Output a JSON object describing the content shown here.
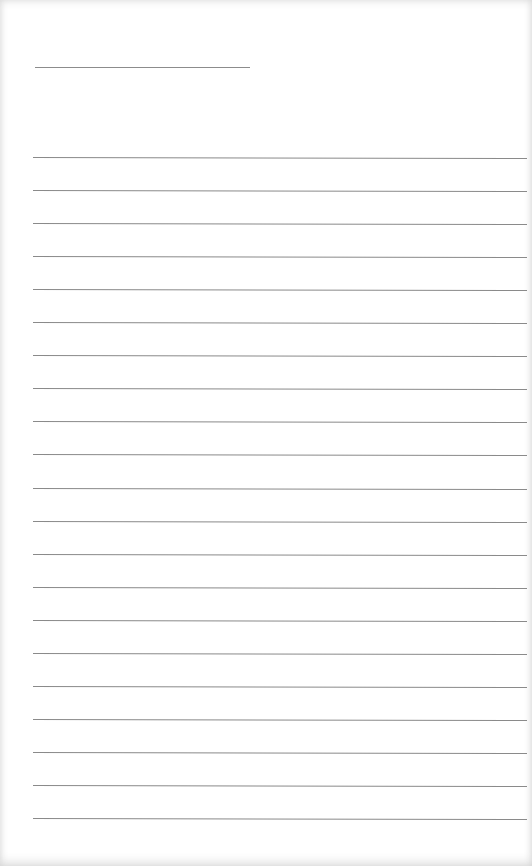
{
  "page": {
    "type": "blank-lined-paper",
    "background_color": "#ffffff",
    "line_color": "#8a8a8a",
    "title_line": {
      "x": 35,
      "y": 67,
      "width": 215
    },
    "ruled_lines": {
      "count": 21,
      "start_y": 157,
      "spacing": 33.05,
      "x": 33,
      "width": 494
    },
    "text": ""
  }
}
